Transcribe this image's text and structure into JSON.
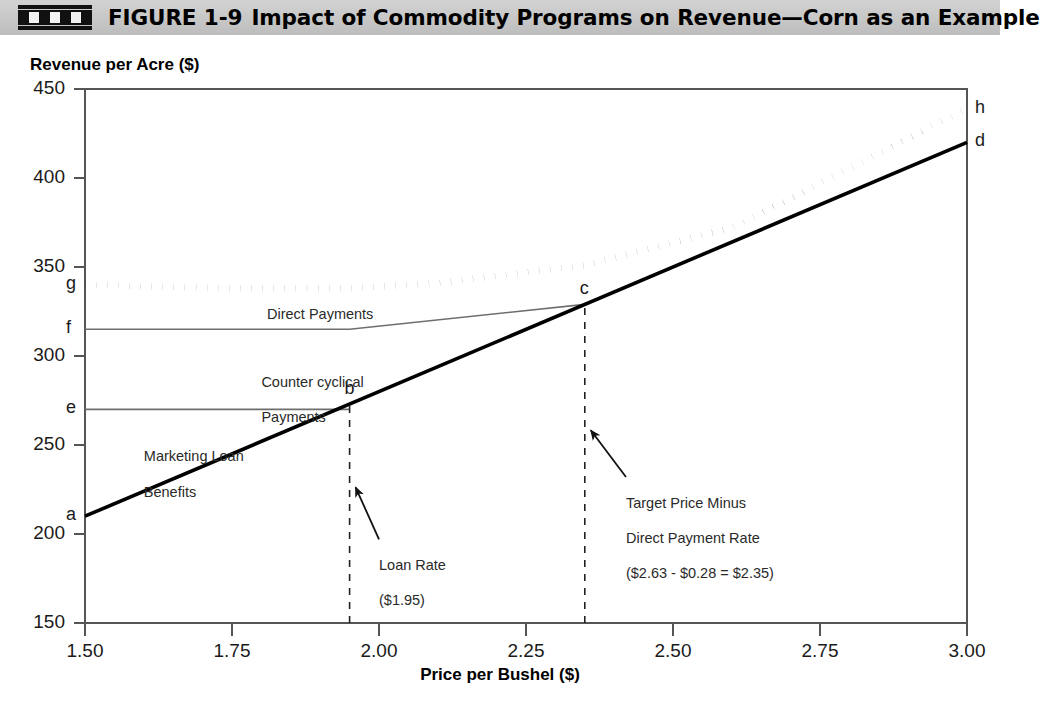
{
  "header": {
    "figure_number": "FIGURE 1-9",
    "title": "Impact of Commodity Programs on Revenue—Corn as an Example",
    "icon": "figure-marker-icon",
    "band_color": "#c9c9c9"
  },
  "chart_data": {
    "type": "line",
    "title": "Impact of Commodity Programs on Revenue—Corn as an Example",
    "xlabel": "Price per Bushel ($)",
    "ylabel": "Revenue per Acre ($)",
    "xlim": [
      1.5,
      3.0
    ],
    "ylim": [
      150,
      450
    ],
    "xticks": [
      "1.50",
      "1.75",
      "2.00",
      "2.25",
      "2.50",
      "2.75",
      "3.00"
    ],
    "xtick_values": [
      1.5,
      1.75,
      2.0,
      2.25,
      2.5,
      2.75,
      3.0
    ],
    "yticks": [
      "450",
      "400",
      "350",
      "300",
      "250",
      "200",
      "150"
    ],
    "ytick_values": [
      450,
      400,
      350,
      300,
      250,
      200,
      150
    ],
    "grid": false,
    "legend": "none",
    "series": [
      {
        "name": "Total Revenue with Direct Payments",
        "style": "dotted",
        "color": "#000000",
        "x": [
          1.5,
          1.75,
          1.95,
          2.1,
          2.35,
          2.6,
          3.0
        ],
        "y": [
          340,
          338,
          338,
          341,
          351,
          372,
          439
        ]
      },
      {
        "name": "Revenue with Counter cyclical Payments",
        "style": "solid-thin",
        "color": "#6e6e6e",
        "x": [
          1.5,
          1.95,
          2.35
        ],
        "y": [
          315,
          315,
          329
        ]
      },
      {
        "name": "Marketing Loan Benefit Floor",
        "style": "solid-thin",
        "color": "#6e6e6e",
        "x": [
          1.5,
          1.95
        ],
        "y": [
          270,
          270
        ]
      },
      {
        "name": "Market Revenue",
        "style": "solid-thick",
        "color": "#000000",
        "x": [
          1.5,
          3.0
        ],
        "y": [
          210,
          420
        ]
      }
    ],
    "points": [
      {
        "label": "a",
        "x": 1.5,
        "y": 210
      },
      {
        "label": "b",
        "x": 1.95,
        "y": 273
      },
      {
        "label": "c",
        "x": 2.35,
        "y": 329
      },
      {
        "label": "d",
        "x": 3.0,
        "y": 420
      },
      {
        "label": "e",
        "x": 1.5,
        "y": 270
      },
      {
        "label": "f",
        "x": 1.5,
        "y": 315
      },
      {
        "label": "g",
        "x": 1.5,
        "y": 340
      },
      {
        "label": "h",
        "x": 3.0,
        "y": 439
      }
    ],
    "vertical_reference_lines": [
      {
        "x": 1.95,
        "style": "dashed",
        "from": 150,
        "to": 273
      },
      {
        "x": 2.35,
        "style": "dashed",
        "from": 150,
        "to": 329
      }
    ],
    "annotations": [
      {
        "name": "direct-payments",
        "text": "Direct Payments",
        "x": 1.9,
        "y": 328
      },
      {
        "name": "counter-cyclical-payments",
        "text": "Counter cyclical\nPayments",
        "x": 1.8,
        "y": 300
      },
      {
        "name": "marketing-loan-benefits",
        "text": "Marketing Loan\nBenefits",
        "x": 1.6,
        "y": 258
      },
      {
        "name": "loan-rate",
        "text": "Loan Rate\n($1.95)",
        "x": 2.0,
        "y": 197,
        "arrow_to": {
          "x": 1.95,
          "y": 224
        }
      },
      {
        "name": "target-price-minus-direct-payment-rate",
        "text": "Target Price Minus\nDirect Payment Rate\n($2.63 - $0.28 = $2.35)",
        "x": 2.42,
        "y": 232,
        "arrow_to": {
          "x": 2.35,
          "y": 256
        }
      }
    ]
  },
  "annotation_labels": {
    "direct_payments": "Direct Payments",
    "counter_cyclical_line1": "Counter cyclical",
    "counter_cyclical_line2": "Payments",
    "marketing_loan_line1": "Marketing Loan",
    "marketing_loan_line2": "Benefits",
    "loan_rate_line1": "Loan Rate",
    "loan_rate_line2": "($1.95)",
    "target_price_line1": "Target Price Minus",
    "target_price_line2": "Direct Payment Rate",
    "target_price_line3": "($2.63 - $0.28 = $2.35)"
  },
  "point_labels": {
    "a": "a",
    "b": "b",
    "c": "c",
    "d": "d",
    "e": "e",
    "f": "f",
    "g": "g",
    "h": "h"
  },
  "axis_titles": {
    "y": "Revenue per Acre ($)",
    "x": "Price per Bushel ($)"
  }
}
